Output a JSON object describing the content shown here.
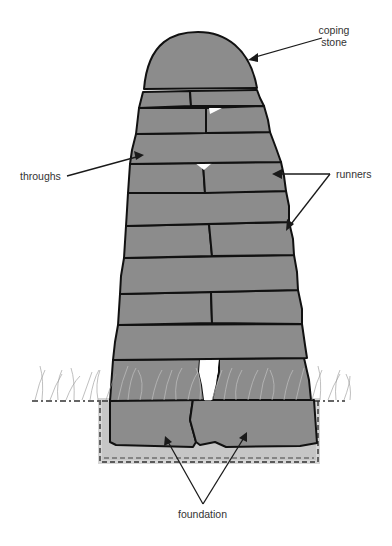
{
  "diagram": {
    "colors": {
      "stone": "#8c8c8c",
      "outline": "#111111",
      "label_text": "#333333",
      "trench": "#b0b0b0",
      "background": "#ffffff"
    },
    "labels": {
      "coping_stone_line1": "coping",
      "coping_stone_line2": "stone",
      "throughs": "throughs",
      "runners": "runners",
      "foundation": "foundation"
    },
    "components": [
      {
        "name": "coping stone",
        "count": 1
      },
      {
        "name": "throughs",
        "count": 1
      },
      {
        "name": "runners",
        "count": 2
      },
      {
        "name": "foundation",
        "count": 2
      }
    ]
  }
}
